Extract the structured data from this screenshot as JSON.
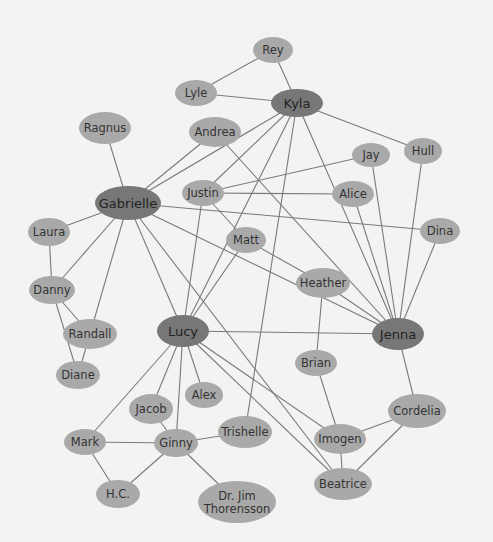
{
  "diagram": {
    "type": "social-network-graph",
    "colors": {
      "background": "#f3f3f1",
      "node_light": "#a9a9a9",
      "node_dark": "#777777",
      "edge": "#7a7a7a",
      "text": "#333333"
    },
    "nodes": [
      {
        "id": "rey",
        "label": "Rey",
        "x": 273,
        "y": 50,
        "rx": 20,
        "ry": 13,
        "hub": false
      },
      {
        "id": "lyle",
        "label": "Lyle",
        "x": 196,
        "y": 93,
        "rx": 21,
        "ry": 13,
        "hub": false
      },
      {
        "id": "kyla",
        "label": "Kyla",
        "x": 297,
        "y": 103,
        "rx": 26,
        "ry": 14,
        "hub": true
      },
      {
        "id": "ragnus",
        "label": "Ragnus",
        "x": 105,
        "y": 128,
        "rx": 26,
        "ry": 16,
        "hub": false
      },
      {
        "id": "andrea",
        "label": "Andrea",
        "x": 215,
        "y": 132,
        "rx": 26,
        "ry": 15,
        "hub": false
      },
      {
        "id": "hull",
        "label": "Hull",
        "x": 423,
        "y": 151,
        "rx": 19,
        "ry": 13,
        "hub": false
      },
      {
        "id": "jay",
        "label": "Jay",
        "x": 371,
        "y": 155,
        "rx": 19,
        "ry": 12,
        "hub": false
      },
      {
        "id": "gabrielle",
        "label": "Gabrielle",
        "x": 128,
        "y": 203,
        "rx": 33,
        "ry": 17,
        "hub": true
      },
      {
        "id": "justin",
        "label": "Justin",
        "x": 203,
        "y": 193,
        "rx": 21,
        "ry": 13,
        "hub": false
      },
      {
        "id": "alice",
        "label": "Alice",
        "x": 353,
        "y": 194,
        "rx": 21,
        "ry": 13,
        "hub": false
      },
      {
        "id": "laura",
        "label": "Laura",
        "x": 49,
        "y": 232,
        "rx": 21,
        "ry": 14,
        "hub": false
      },
      {
        "id": "dina",
        "label": "Dina",
        "x": 440,
        "y": 231,
        "rx": 20,
        "ry": 13,
        "hub": false
      },
      {
        "id": "matt",
        "label": "Matt",
        "x": 246,
        "y": 240,
        "rx": 20,
        "ry": 13,
        "hub": false
      },
      {
        "id": "heather",
        "label": "Heather",
        "x": 323,
        "y": 283,
        "rx": 27,
        "ry": 15,
        "hub": false
      },
      {
        "id": "danny",
        "label": "Danny",
        "x": 52,
        "y": 290,
        "rx": 23,
        "ry": 14,
        "hub": false
      },
      {
        "id": "randall",
        "label": "Randall",
        "x": 90,
        "y": 334,
        "rx": 27,
        "ry": 15,
        "hub": false
      },
      {
        "id": "lucy",
        "label": "Lucy",
        "x": 183,
        "y": 331,
        "rx": 26,
        "ry": 16,
        "hub": true
      },
      {
        "id": "jenna",
        "label": "Jenna",
        "x": 398,
        "y": 334,
        "rx": 26,
        "ry": 16,
        "hub": true
      },
      {
        "id": "brian",
        "label": "Brian",
        "x": 316,
        "y": 363,
        "rx": 21,
        "ry": 13,
        "hub": false
      },
      {
        "id": "diane",
        "label": "Diane",
        "x": 78,
        "y": 375,
        "rx": 22,
        "ry": 14,
        "hub": false
      },
      {
        "id": "alex",
        "label": "Alex",
        "x": 204,
        "y": 395,
        "rx": 19,
        "ry": 13,
        "hub": false
      },
      {
        "id": "jacob",
        "label": "Jacob",
        "x": 151,
        "y": 409,
        "rx": 22,
        "ry": 15,
        "hub": false
      },
      {
        "id": "cordelia",
        "label": "Cordelia",
        "x": 417,
        "y": 411,
        "rx": 29,
        "ry": 17,
        "hub": false
      },
      {
        "id": "mark",
        "label": "Mark",
        "x": 85,
        "y": 442,
        "rx": 21,
        "ry": 13,
        "hub": false
      },
      {
        "id": "ginny",
        "label": "Ginny",
        "x": 176,
        "y": 443,
        "rx": 22,
        "ry": 14,
        "hub": false
      },
      {
        "id": "trishelle",
        "label": "Trishelle",
        "x": 245,
        "y": 432,
        "rx": 27,
        "ry": 16,
        "hub": false
      },
      {
        "id": "imogen",
        "label": "Imogen",
        "x": 340,
        "y": 439,
        "rx": 26,
        "ry": 15,
        "hub": false
      },
      {
        "id": "hc",
        "label": "H.C.",
        "x": 118,
        "y": 494,
        "rx": 22,
        "ry": 14,
        "hub": false
      },
      {
        "id": "beatrice",
        "label": "Beatrice",
        "x": 343,
        "y": 484,
        "rx": 29,
        "ry": 16,
        "hub": false
      },
      {
        "id": "drjim",
        "label": "Dr. Jim Thorensson",
        "label_lines": [
          "Dr. Jim",
          "Thorensson"
        ],
        "x": 237,
        "y": 502,
        "rx": 39,
        "ry": 21,
        "hub": false
      }
    ],
    "edges": [
      [
        "rey",
        "lyle"
      ],
      [
        "rey",
        "kyla"
      ],
      [
        "lyle",
        "kyla"
      ],
      [
        "kyla",
        "hull"
      ],
      [
        "kyla",
        "gabrielle"
      ],
      [
        "kyla",
        "justin"
      ],
      [
        "kyla",
        "lucy"
      ],
      [
        "kyla",
        "trishelle"
      ],
      [
        "kyla",
        "jenna"
      ],
      [
        "ragnus",
        "gabrielle"
      ],
      [
        "andrea",
        "gabrielle"
      ],
      [
        "andrea",
        "jenna"
      ],
      [
        "hull",
        "jenna"
      ],
      [
        "jay",
        "justin"
      ],
      [
        "jay",
        "jenna"
      ],
      [
        "justin",
        "alice"
      ],
      [
        "justin",
        "lucy"
      ],
      [
        "justin",
        "matt"
      ],
      [
        "alice",
        "jenna"
      ],
      [
        "dina",
        "jenna"
      ],
      [
        "gabrielle",
        "dina"
      ],
      [
        "gabrielle",
        "laura"
      ],
      [
        "gabrielle",
        "danny"
      ],
      [
        "gabrielle",
        "randall"
      ],
      [
        "gabrielle",
        "lucy"
      ],
      [
        "gabrielle",
        "jenna"
      ],
      [
        "gabrielle",
        "beatrice"
      ],
      [
        "laura",
        "danny"
      ],
      [
        "danny",
        "randall"
      ],
      [
        "danny",
        "diane"
      ],
      [
        "randall",
        "diane"
      ],
      [
        "matt",
        "lucy"
      ],
      [
        "matt",
        "heather"
      ],
      [
        "heather",
        "jenna"
      ],
      [
        "heather",
        "brian"
      ],
      [
        "lucy",
        "jenna"
      ],
      [
        "lucy",
        "mark"
      ],
      [
        "lucy",
        "jacob"
      ],
      [
        "lucy",
        "ginny"
      ],
      [
        "lucy",
        "alex"
      ],
      [
        "lucy",
        "imogen"
      ],
      [
        "lucy",
        "beatrice"
      ],
      [
        "jenna",
        "cordelia"
      ],
      [
        "brian",
        "imogen"
      ],
      [
        "cordelia",
        "imogen"
      ],
      [
        "cordelia",
        "beatrice"
      ],
      [
        "imogen",
        "beatrice"
      ],
      [
        "mark",
        "ginny"
      ],
      [
        "mark",
        "hc"
      ],
      [
        "jacob",
        "ginny"
      ],
      [
        "ginny",
        "hc"
      ],
      [
        "ginny",
        "trishelle"
      ],
      [
        "ginny",
        "drjim"
      ]
    ]
  }
}
